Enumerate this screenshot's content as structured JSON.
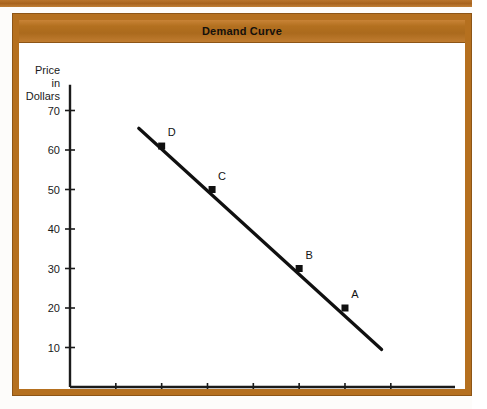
{
  "figure": {
    "title": "Demand Curve",
    "frame_color": "#b5701f",
    "title_bar_color": "#b3701f",
    "background_color": "#ffffff"
  },
  "chart_data": {
    "type": "line",
    "title": "Demand Curve",
    "xlabel": "Quantity",
    "ylabel": "Price in Dollars",
    "ylabel_lines": [
      "Price",
      "in",
      "Dollars"
    ],
    "xlim": [
      0,
      75
    ],
    "ylim": [
      0,
      75
    ],
    "xticks": [
      10,
      20,
      30,
      40,
      50,
      60,
      70
    ],
    "yticks": [
      10,
      20,
      30,
      40,
      50,
      60,
      70
    ],
    "xtick_labels": [
      "10",
      "20",
      "30",
      "40",
      "50",
      "60",
      "70"
    ],
    "ytick_labels": [
      "10",
      "20",
      "30",
      "40",
      "50",
      "60",
      "70"
    ],
    "grid": false,
    "legend": false,
    "line_color": "#101010",
    "line_endpoints": [
      {
        "x": 15,
        "y": 65.5
      },
      {
        "x": 68,
        "y": 9.5
      }
    ],
    "series": [
      {
        "name": "Demand",
        "points": [
          {
            "label": "D",
            "x": 20,
            "y": 61
          },
          {
            "label": "C",
            "x": 31,
            "y": 50
          },
          {
            "label": "B",
            "x": 50,
            "y": 30
          },
          {
            "label": "A",
            "x": 60,
            "y": 20
          }
        ]
      }
    ],
    "annotations": [
      {
        "text": "D",
        "x": 20,
        "y": 61,
        "dx": 10,
        "dy": -10
      },
      {
        "text": "C",
        "x": 31,
        "y": 50,
        "dx": 10,
        "dy": -10
      },
      {
        "text": "B",
        "x": 50,
        "y": 30,
        "dx": 10,
        "dy": -10
      },
      {
        "text": "A",
        "x": 60,
        "y": 20,
        "dx": 10,
        "dy": -10
      }
    ]
  }
}
